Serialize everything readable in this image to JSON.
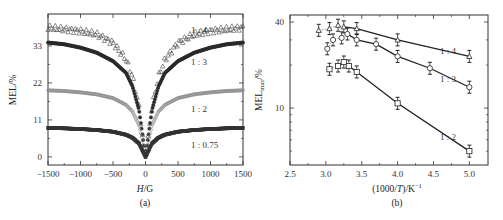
{
  "chart_data": [
    {
      "panel": "(a)",
      "type": "scatter",
      "title": "",
      "xlabel": "H/G",
      "ylabel": "MEL/%",
      "xlim": [
        -1500,
        1500
      ],
      "ylim": [
        -2.4,
        42.5
      ],
      "xticks": [
        -1500,
        -1000,
        -500,
        0,
        500,
        1000,
        1500
      ],
      "yticks": [
        0,
        11,
        22,
        33
      ],
      "grid": false,
      "legend": "inline labels at right",
      "series": [
        {
          "name": "1 : 4",
          "marker": "triangle-open",
          "x": [
            -1500,
            -1250,
            -1000,
            -750,
            -500,
            -300,
            -200,
            -100,
            -50,
            0,
            50,
            100,
            200,
            300,
            500,
            750,
            1000,
            1250,
            1500
          ],
          "values": [
            38.5,
            38,
            37.5,
            36.5,
            34,
            29,
            24,
            15,
            7,
            0,
            7,
            15,
            24,
            29,
            34,
            36.5,
            37.5,
            38,
            38.5
          ]
        },
        {
          "name": "1 : 3",
          "marker": "circle-filled",
          "x": [
            -1500,
            -1250,
            -1000,
            -750,
            -500,
            -300,
            -200,
            -100,
            -50,
            0,
            50,
            100,
            200,
            300,
            500,
            750,
            1000,
            1250,
            1500
          ],
          "values": [
            34,
            33.5,
            32.5,
            31,
            28.5,
            25,
            21,
            14,
            7,
            0,
            7,
            14,
            21,
            25,
            28.5,
            31,
            32.5,
            33.5,
            34
          ]
        },
        {
          "name": "1 : 2",
          "marker": "circle-open-gray",
          "x": [
            -1500,
            -1250,
            -1000,
            -750,
            -500,
            -300,
            -200,
            -100,
            -50,
            0,
            50,
            100,
            200,
            300,
            500,
            750,
            1000,
            1250,
            1500
          ],
          "values": [
            19.8,
            19.6,
            19.2,
            18.6,
            17.5,
            15.5,
            13.5,
            9.5,
            5,
            0,
            5,
            9.5,
            13.5,
            15.5,
            17.5,
            18.6,
            19.2,
            19.6,
            19.8
          ]
        },
        {
          "name": "1 : 0.75",
          "marker": "square-filled",
          "x": [
            -1500,
            -1250,
            -1000,
            -750,
            -500,
            -300,
            -200,
            -100,
            -50,
            0,
            50,
            100,
            200,
            300,
            500,
            750,
            1000,
            1250,
            1500
          ],
          "values": [
            8.6,
            8.5,
            8.3,
            8.0,
            7.5,
            6.6,
            5.7,
            4,
            2,
            0,
            2,
            4,
            5.7,
            6.6,
            7.5,
            8.0,
            8.3,
            8.5,
            8.6
          ]
        }
      ]
    },
    {
      "panel": "(b)",
      "type": "scatter",
      "title": "",
      "xlabel": "(1000/T)/K⁻¹",
      "ylabel": "MELmax/%",
      "xlim": [
        2.5,
        5.26
      ],
      "ylim": [
        4.0,
        44.8
      ],
      "yscale": "log",
      "xticks": [
        2.5,
        3.0,
        3.5,
        4.0,
        4.5,
        5.0
      ],
      "yticks": [
        10,
        40
      ],
      "grid": false,
      "error_bars": true,
      "legend": "inline labels",
      "series": [
        {
          "name": "1 : 4",
          "marker": "triangle-open",
          "x": [
            2.9,
            3.05,
            3.17,
            3.25,
            3.43,
            4.0,
            5.0
          ],
          "values": [
            35,
            36,
            38,
            37,
            36,
            30,
            23
          ],
          "fit_from": 3.25
        },
        {
          "name": "1 : 3",
          "marker": "circle-open",
          "x": [
            3.02,
            3.1,
            3.22,
            3.3,
            3.43,
            3.7,
            4.0,
            4.45,
            5.0
          ],
          "values": [
            26,
            30,
            31,
            33,
            30,
            28,
            23,
            19,
            14
          ],
          "fit_from": 3.3
        },
        {
          "name": "1 : 2",
          "marker": "square-open",
          "x": [
            3.05,
            3.17,
            3.25,
            3.32,
            3.43,
            4.0,
            5.0
          ],
          "values": [
            18.7,
            19.7,
            21,
            19.7,
            17.9,
            10.8,
            5.0
          ],
          "fit_from": 3.32
        }
      ]
    }
  ],
  "panels": {
    "a": {
      "caption": "(a)",
      "xlabel_italic": "H",
      "xlabel_rest": "/G",
      "ylabel": "MEL/%",
      "xtick_labels": [
        "−1500",
        "−1000",
        "−500",
        "0",
        "500",
        "1000",
        "1500"
      ],
      "ytick_labels": [
        "0",
        "11",
        "22",
        "33"
      ],
      "series_labels": [
        "1 : 4",
        "1 : 3",
        "1 : 2",
        "1 : 0.75"
      ]
    },
    "b": {
      "caption": "(b)",
      "xlabel_pre": "(1000/",
      "xlabel_italic": "T",
      "xlabel_post": ")/K",
      "xlabel_sup": "−1",
      "ylabel_main": "MEL",
      "ylabel_sub": "max",
      "ylabel_post": "/%",
      "xtick_labels": [
        "2.5",
        "3.0",
        "3.5",
        "4.0",
        "4.5",
        "5.0"
      ],
      "ytick_labels": [
        "10",
        "40"
      ],
      "series_labels": [
        "1 : 4",
        "1 : 3",
        "1 : 2"
      ]
    }
  }
}
